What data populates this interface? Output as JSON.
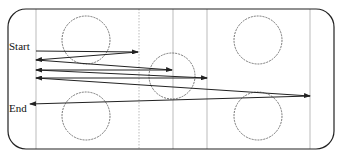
{
  "labels": {
    "start": "Start",
    "end": "End"
  },
  "border": {
    "x": 8,
    "y": 9,
    "width": 326,
    "height": 140,
    "radius": 18,
    "color": "#222222"
  },
  "dividers": [
    {
      "x": 36,
      "style": "solid"
    },
    {
      "x": 139,
      "style": "dotted"
    },
    {
      "x": 173,
      "style": "solid"
    },
    {
      "x": 207,
      "style": "solid"
    },
    {
      "x": 310,
      "style": "solid"
    }
  ],
  "circles": [
    {
      "name": "top-left",
      "cx": 86,
      "cy": 40,
      "r": 24
    },
    {
      "name": "top-right",
      "cx": 258,
      "cy": 40,
      "r": 24
    },
    {
      "name": "middle",
      "cx": 172,
      "cy": 76,
      "r": 23
    },
    {
      "name": "bottom-left",
      "cx": 86,
      "cy": 116,
      "r": 24
    },
    {
      "name": "bottom-right",
      "cx": 258,
      "cy": 116,
      "r": 24
    }
  ],
  "path": [
    {
      "from": [
        36,
        51
      ],
      "to": [
        138,
        52
      ]
    },
    {
      "from": [
        138,
        52
      ],
      "to": [
        36,
        60
      ]
    },
    {
      "from": [
        36,
        60
      ],
      "to": [
        172,
        70
      ]
    },
    {
      "from": [
        172,
        70
      ],
      "to": [
        36,
        70
      ]
    },
    {
      "from": [
        36,
        70
      ],
      "to": [
        207,
        78
      ]
    },
    {
      "from": [
        207,
        78
      ],
      "to": [
        36,
        78
      ]
    },
    {
      "from": [
        36,
        78
      ],
      "to": [
        310,
        96
      ]
    },
    {
      "from": [
        310,
        96
      ],
      "to": [
        30,
        104
      ]
    }
  ],
  "colors": {
    "line": "#222222",
    "divider": "#aaaaaa",
    "circle": "#666666"
  }
}
